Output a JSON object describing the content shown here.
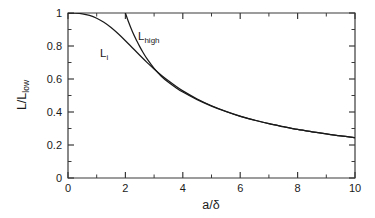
{
  "chart_data": {
    "type": "line",
    "title": "",
    "xlabel": "a/δ",
    "ylabel": "L/L_low",
    "ylabel_main": "L/L",
    "ylabel_sub": "low",
    "xlim": [
      0,
      10
    ],
    "ylim": [
      0,
      1
    ],
    "grid": false,
    "legend": "inline-curve-labels",
    "xticks": [
      0,
      2,
      4,
      6,
      8,
      10
    ],
    "xtick_labels": [
      "0",
      "2",
      "4",
      "6",
      "8",
      "10"
    ],
    "xticks_minor": [
      1,
      3,
      5,
      7,
      9
    ],
    "yticks": [
      0,
      0.2,
      0.4,
      0.6,
      0.8,
      1
    ],
    "ytick_labels": [
      "0",
      "0.2",
      "0.4",
      "0.6",
      "0.8",
      "1"
    ],
    "yticks_minor": [
      0.1,
      0.3,
      0.5,
      0.7,
      0.9
    ],
    "series": [
      {
        "name": "L_i",
        "label_main": "L",
        "label_sub": "i",
        "color": "#1a1a1a",
        "x": [
          0,
          0.25,
          0.5,
          0.75,
          1,
          1.25,
          1.5,
          1.75,
          2,
          2.25,
          2.5,
          2.75,
          3,
          3.25,
          3.5,
          3.75,
          4,
          4.5,
          5,
          5.5,
          6,
          6.5,
          7,
          7.5,
          8,
          8.5,
          9,
          9.5,
          10
        ],
        "y": [
          1,
          0.999,
          0.995,
          0.985,
          0.968,
          0.944,
          0.912,
          0.874,
          0.832,
          0.788,
          0.744,
          0.701,
          0.661,
          0.623,
          0.589,
          0.557,
          0.528,
          0.479,
          0.438,
          0.404,
          0.375,
          0.351,
          0.329,
          0.311,
          0.294,
          0.28,
          0.267,
          0.255,
          0.245
        ]
      },
      {
        "name": "L_high",
        "label_main": "L",
        "label_sub": "high",
        "color": "#1a1a1a",
        "x": [
          2,
          2.1,
          2.25,
          2.4,
          2.5,
          2.6,
          2.75,
          3,
          3.25,
          3.5,
          3.75,
          4,
          4.5,
          5,
          5.5,
          6,
          6.5,
          7,
          7.5,
          8,
          8.5,
          9,
          9.5,
          10
        ],
        "y": [
          1.0,
          0.95,
          0.885,
          0.83,
          0.796,
          0.765,
          0.723,
          0.664,
          0.617,
          0.58,
          0.549,
          0.521,
          0.475,
          0.436,
          0.403,
          0.374,
          0.35,
          0.329,
          0.311,
          0.294,
          0.28,
          0.267,
          0.255,
          0.245
        ]
      }
    ],
    "annotations": [
      {
        "text": "L_i",
        "x": 1.45,
        "y": 0.78
      },
      {
        "text": "L_high",
        "x": 2.95,
        "y": 0.88
      }
    ]
  },
  "figure": {
    "background_color": "#ffffff",
    "axis_color": "#3a3a3a",
    "curve_color": "#1a1a1a"
  }
}
